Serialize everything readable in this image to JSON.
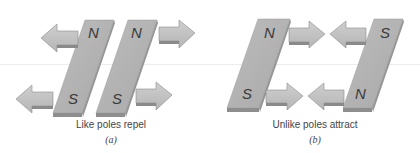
{
  "panels": [
    {
      "id": "a",
      "caption": "Like poles repel",
      "sublabel": "(a)",
      "magnets": [
        {
          "top_pole": "N",
          "bottom_pole": "S"
        },
        {
          "top_pole": "N",
          "bottom_pole": "S"
        }
      ],
      "arrows": [
        "left",
        "right",
        "left",
        "right"
      ]
    },
    {
      "id": "b",
      "caption": "Unlike poles attract",
      "sublabel": "(b)",
      "magnets": [
        {
          "top_pole": "N",
          "bottom_pole": "S"
        },
        {
          "top_pole": "S",
          "bottom_pole": "N"
        }
      ],
      "arrows": [
        "right",
        "left",
        "right",
        "left"
      ]
    }
  ],
  "colors": {
    "magnet_face": "#b4b4b4",
    "magnet_edge": "#8e8e8e",
    "arrow_face": "#c2c2c2",
    "arrow_edge": "#8a8a8a",
    "text": "#3a3a3a"
  }
}
